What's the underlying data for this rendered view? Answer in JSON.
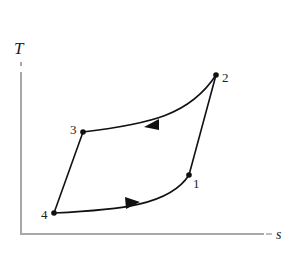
{
  "diagram": {
    "type": "T-s cycle diagram",
    "axes": {
      "y_label": "T",
      "x_label": "s",
      "x_label_prefix": "–",
      "axis_color": "#9a9a9a"
    },
    "points": [
      {
        "id": "1",
        "label": "1",
        "x": 189,
        "y": 175
      },
      {
        "id": "2",
        "label": "2",
        "x": 216,
        "y": 75
      },
      {
        "id": "3",
        "label": "3",
        "x": 83,
        "y": 132
      },
      {
        "id": "4",
        "label": "4",
        "x": 54,
        "y": 213
      }
    ],
    "processes": [
      {
        "from": "1",
        "to": "2",
        "shape": "straight"
      },
      {
        "from": "2",
        "to": "3",
        "shape": "curve",
        "arrow": "toward 3"
      },
      {
        "from": "3",
        "to": "4",
        "shape": "straight"
      },
      {
        "from": "4",
        "to": "1",
        "shape": "curve",
        "arrow": "toward 1"
      }
    ],
    "line_color": "#111111"
  }
}
